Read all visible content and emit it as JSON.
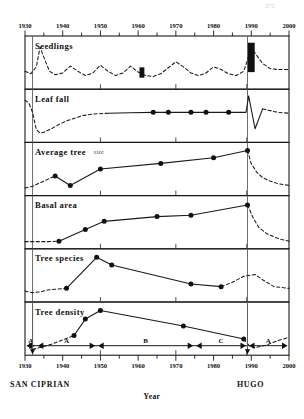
{
  "figure": {
    "page_number": "272",
    "axis": {
      "x_title": "Year",
      "x_min": 1930,
      "x_max": 2000,
      "tick_labels_top": [
        "1930",
        "1940",
        "1950",
        "1960",
        "1970",
        "1980",
        "1990",
        "2000"
      ],
      "tick_labels_bottom": [
        "1930",
        "1940",
        "1950",
        "1960",
        "1970",
        "1980",
        "1990",
        "2000"
      ],
      "minor_tick_step": 5,
      "major_tick_step": 10
    },
    "events": [
      {
        "name": "SAN CIPRIAN",
        "year": 1932,
        "label_anchor": "start"
      },
      {
        "name": "HUGO",
        "year": 1989,
        "label_anchor": "middle"
      }
    ],
    "phases": [
      {
        "label": "A",
        "start": 1930,
        "end": 1933
      },
      {
        "label": "A",
        "start": 1933,
        "end": 1949
      },
      {
        "label": "B",
        "start": 1949,
        "end": 1975
      },
      {
        "label": "C",
        "start": 1975,
        "end": 1989
      },
      {
        "label": "A",
        "start": 1989,
        "end": 2000
      }
    ],
    "panel_count": 6
  },
  "chart_data": [
    {
      "type": "line",
      "title": "Seedlings",
      "xlabel": "Year",
      "ylabel": "",
      "xlim": [
        1930,
        2000
      ],
      "ylim": [
        0,
        1
      ],
      "grid": false,
      "legend": "none",
      "series": [
        {
          "name": "Seedlings (relative abundance)",
          "style": "dashed",
          "markers": "none",
          "x": [
            1930,
            1931.5,
            1933,
            1934,
            1935,
            1936.5,
            1938,
            1940,
            1942,
            1944,
            1946,
            1948,
            1950,
            1952,
            1954,
            1956,
            1958,
            1960,
            1962,
            1964,
            1966,
            1968,
            1970,
            1972,
            1974,
            1976,
            1978,
            1980,
            1982,
            1984,
            1986,
            1988,
            1989,
            1990,
            1991,
            1993,
            1995,
            1997,
            2000
          ],
          "y": [
            0.3,
            0.24,
            0.4,
            0.86,
            0.62,
            0.3,
            0.22,
            0.26,
            0.42,
            0.3,
            0.2,
            0.26,
            0.44,
            0.3,
            0.2,
            0.26,
            0.42,
            0.28,
            0.2,
            0.18,
            0.24,
            0.38,
            0.52,
            0.4,
            0.26,
            0.2,
            0.26,
            0.4,
            0.34,
            0.24,
            0.2,
            0.3,
            0.56,
            0.86,
            0.72,
            0.48,
            0.36,
            0.34,
            0.34
          ]
        }
      ],
      "annotations": [
        {
          "kind": "bar-marker",
          "year": 1961,
          "height_frac": 0.24,
          "center_frac": 0.27,
          "width_years": 1.3
        },
        {
          "kind": "bar-marker",
          "year": 1990,
          "height_frac": 0.68,
          "center_frac": 0.62,
          "width_years": 1.8
        }
      ]
    },
    {
      "type": "line",
      "title": "Leaf fall",
      "xlabel": "Year",
      "ylabel": "",
      "xlim": [
        1930,
        2000
      ],
      "ylim": [
        0,
        1
      ],
      "grid": false,
      "legend": "none",
      "series": [
        {
          "name": "Leaf fall (pre-measurement reconstruction)",
          "style": "dashed",
          "markers": "none",
          "x": [
            1930,
            1931,
            1932,
            1933,
            1934,
            1935,
            1937,
            1939,
            1941,
            1943,
            1945,
            1948,
            1952
          ],
          "y": [
            0.86,
            0.8,
            0.58,
            0.18,
            0.1,
            0.12,
            0.2,
            0.3,
            0.38,
            0.44,
            0.5,
            0.54,
            0.56
          ]
        },
        {
          "name": "Leaf fall (measured)",
          "style": "solid",
          "markers": "circle",
          "x": [
            1952,
            1958,
            1964,
            1968,
            1974,
            1978,
            1984,
            1988.6,
            1989.3,
            1991,
            1993
          ],
          "y": [
            0.56,
            0.57,
            0.58,
            0.58,
            0.58,
            0.58,
            0.58,
            0.58,
            0.96,
            0.2,
            0.66
          ],
          "marker_x": [
            1964,
            1968,
            1974,
            1978,
            1984
          ],
          "marker_y": [
            0.58,
            0.58,
            0.58,
            0.58,
            0.58
          ]
        },
        {
          "name": "Leaf fall (post-Hugo recovery)",
          "style": "dashed",
          "markers": "none",
          "x": [
            1993,
            1995,
            1997,
            2000
          ],
          "y": [
            0.66,
            0.62,
            0.58,
            0.56
          ]
        }
      ],
      "annotations": []
    },
    {
      "type": "line",
      "title": "Average tree",
      "title_suffix": "size",
      "xlabel": "Year",
      "ylabel": "",
      "xlim": [
        1930,
        2000
      ],
      "ylim": [
        0,
        1
      ],
      "grid": false,
      "legend": "none",
      "series": [
        {
          "name": "Average tree size (early reconstruction)",
          "style": "dashed",
          "markers": "none",
          "x": [
            1930,
            1932,
            1934,
            1936,
            1938
          ],
          "y": [
            0.06,
            0.1,
            0.18,
            0.26,
            0.34
          ]
        },
        {
          "name": "Average tree size (measured)",
          "style": "solid",
          "markers": "circle",
          "x": [
            1938,
            1942,
            1950,
            1966,
            1980,
            1989
          ],
          "y": [
            0.34,
            0.12,
            0.5,
            0.63,
            0.76,
            0.93
          ],
          "marker_x": [
            1938,
            1942,
            1950,
            1966,
            1980,
            1989
          ],
          "marker_y": [
            0.34,
            0.12,
            0.5,
            0.63,
            0.76,
            0.93
          ]
        },
        {
          "name": "Average tree size (post-Hugo decline)",
          "style": "dashed",
          "markers": "none",
          "x": [
            1989,
            1990,
            1991.5,
            1993,
            1995,
            1997,
            2000
          ],
          "y": [
            0.93,
            0.62,
            0.42,
            0.3,
            0.22,
            0.16,
            0.12
          ]
        }
      ],
      "annotations": []
    },
    {
      "type": "line",
      "title": "Basal area",
      "xlabel": "Year",
      "ylabel": "",
      "xlim": [
        1930,
        2000
      ],
      "ylim": [
        0,
        1
      ],
      "grid": false,
      "legend": "none",
      "series": [
        {
          "name": "Basal area (early reconstruction)",
          "style": "dashed",
          "markers": "none",
          "x": [
            1930,
            1933,
            1936,
            1939
          ],
          "y": [
            0.05,
            0.05,
            0.05,
            0.06
          ]
        },
        {
          "name": "Basal area (measured)",
          "style": "solid",
          "markers": "circle",
          "x": [
            1939,
            1946,
            1951,
            1965,
            1974,
            1989
          ],
          "y": [
            0.06,
            0.33,
            0.52,
            0.63,
            0.66,
            0.9
          ],
          "marker_x": [
            1939,
            1946,
            1951,
            1965,
            1974,
            1989
          ],
          "marker_y": [
            0.06,
            0.33,
            0.52,
            0.63,
            0.66,
            0.9
          ]
        },
        {
          "name": "Basal area (post-Hugo decline)",
          "style": "dashed",
          "markers": "none",
          "x": [
            1989,
            1990.5,
            1992,
            1994,
            1996,
            1998,
            2000
          ],
          "y": [
            0.9,
            0.6,
            0.38,
            0.24,
            0.16,
            0.1,
            0.06
          ]
        }
      ],
      "annotations": []
    },
    {
      "type": "line",
      "title": "Tree species",
      "xlabel": "Year",
      "ylabel": "",
      "xlim": [
        1930,
        2000
      ],
      "ylim": [
        0,
        1
      ],
      "grid": false,
      "legend": "none",
      "series": [
        {
          "name": "Tree species richness (early reconstruction)",
          "style": "dashed",
          "markers": "none",
          "x": [
            1930,
            1932,
            1934,
            1936,
            1938,
            1941
          ],
          "y": [
            0.14,
            0.1,
            0.12,
            0.16,
            0.18,
            0.2
          ]
        },
        {
          "name": "Tree species richness (measured)",
          "style": "solid",
          "markers": "circle",
          "x": [
            1941,
            1949,
            1953,
            1974,
            1982
          ],
          "y": [
            0.2,
            0.92,
            0.74,
            0.3,
            0.24
          ],
          "marker_x": [
            1941,
            1949,
            1953,
            1974,
            1982
          ],
          "marker_y": [
            0.2,
            0.92,
            0.74,
            0.3,
            0.24
          ]
        },
        {
          "name": "Tree species richness (post-Hugo pulse)",
          "style": "dashed",
          "markers": "none",
          "x": [
            1982,
            1985,
            1988,
            1991,
            1993,
            1996,
            2000
          ],
          "y": [
            0.24,
            0.34,
            0.48,
            0.52,
            0.4,
            0.24,
            0.2
          ]
        }
      ],
      "annotations": []
    },
    {
      "type": "line",
      "title": "Tree density",
      "xlabel": "Year",
      "ylabel": "",
      "xlim": [
        1930,
        2000
      ],
      "ylim": [
        0,
        1
      ],
      "grid": false,
      "legend": "none",
      "series": [
        {
          "name": "Tree density (early reconstruction)",
          "style": "dashed",
          "markers": "none",
          "x": [
            1932,
            1934,
            1937,
            1940,
            1943
          ],
          "y": [
            0.02,
            0.06,
            0.14,
            0.24,
            0.34
          ]
        },
        {
          "name": "Tree density (measured)",
          "style": "solid",
          "markers": "circle",
          "x": [
            1943,
            1946,
            1950,
            1972,
            1988
          ],
          "y": [
            0.34,
            0.72,
            0.92,
            0.56,
            0.26
          ],
          "marker_x": [
            1943,
            1946,
            1950,
            1972,
            1988
          ],
          "marker_y": [
            0.34,
            0.72,
            0.92,
            0.56,
            0.26
          ]
        },
        {
          "name": "Tree density (post-Hugo)",
          "style": "dashed",
          "markers": "none",
          "x": [
            1988,
            1989.5,
            1991,
            1994,
            1997,
            2000
          ],
          "y": [
            0.26,
            0.1,
            0.06,
            0.12,
            0.22,
            0.3
          ]
        }
      ],
      "annotations": []
    }
  ]
}
